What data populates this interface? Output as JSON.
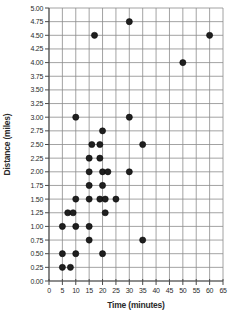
{
  "chart_data": {
    "type": "scatter",
    "title": "",
    "xlabel": "Time (minutes)",
    "ylabel": "Distance (miles)",
    "xlim": [
      0,
      65
    ],
    "ylim": [
      0,
      5
    ],
    "grid": true,
    "legend": null,
    "x_ticks": [
      0,
      5,
      10,
      15,
      20,
      25,
      30,
      35,
      40,
      45,
      50,
      55,
      60,
      65
    ],
    "y_ticks": [
      "0.00",
      "0.25",
      "0.50",
      "0.75",
      "1.00",
      "1.25",
      "1.50",
      "1.75",
      "2.00",
      "2.25",
      "2.50",
      "2.75",
      "3.00",
      "3.25",
      "3.50",
      "3.75",
      "4.00",
      "4.25",
      "4.50",
      "4.75",
      "5.00"
    ],
    "points": [
      [
        30,
        4.75
      ],
      [
        17,
        4.5
      ],
      [
        60,
        4.5
      ],
      [
        50,
        4.0
      ],
      [
        10,
        3.0
      ],
      [
        30,
        3.0
      ],
      [
        20,
        2.75
      ],
      [
        16,
        2.5
      ],
      [
        19,
        2.5
      ],
      [
        35,
        2.5
      ],
      [
        15,
        2.25
      ],
      [
        19,
        2.25
      ],
      [
        15,
        2.0
      ],
      [
        20,
        2.0
      ],
      [
        22,
        2.0
      ],
      [
        30,
        2.0
      ],
      [
        15,
        1.75
      ],
      [
        20,
        1.75
      ],
      [
        10,
        1.5
      ],
      [
        15,
        1.5
      ],
      [
        19,
        1.5
      ],
      [
        21,
        1.5
      ],
      [
        25,
        1.5
      ],
      [
        7,
        1.25
      ],
      [
        9,
        1.25
      ],
      [
        21,
        1.25
      ],
      [
        5,
        1.0
      ],
      [
        10,
        1.0
      ],
      [
        15,
        1.0
      ],
      [
        15,
        0.75
      ],
      [
        35,
        0.75
      ],
      [
        5,
        0.5
      ],
      [
        10,
        0.5
      ],
      [
        20,
        0.5
      ],
      [
        5,
        0.25
      ],
      [
        8,
        0.25
      ]
    ],
    "colors": {
      "point": "#1f1f1f",
      "grid": "#8c8c8c",
      "axis": "#4a4a4a",
      "label": "#2b2b2b",
      "background": "#ffffff"
    }
  }
}
